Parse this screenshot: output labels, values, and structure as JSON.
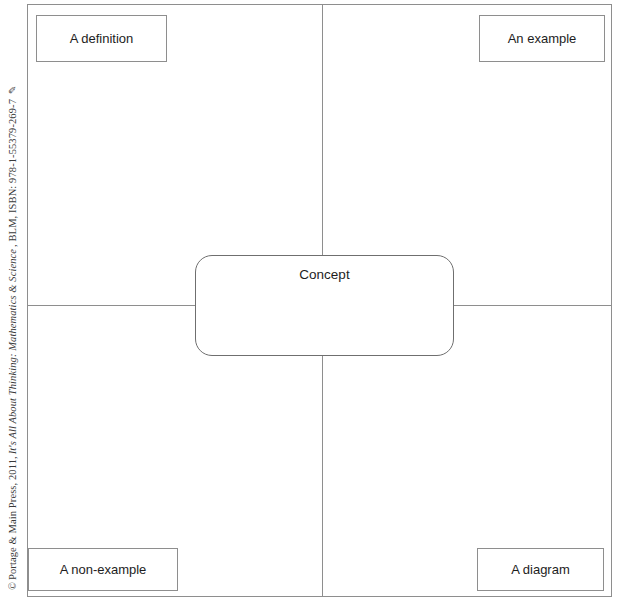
{
  "document": {
    "type": "frayer-model-concept-map",
    "background_color": "#ffffff",
    "line_color": "#8e8e8e",
    "text_color": "#1d1d1d"
  },
  "copyright": {
    "mark": "©",
    "publisher": "Portage & Main Press, 2011,",
    "title": "It's All About Thinking: Mathematics & Science",
    "suffix": ", BLM, ISBN: 978-1-55379-269-7",
    "glyph": "✎"
  },
  "center": {
    "label": "Concept"
  },
  "quadrants": {
    "top_left": {
      "label": "A definition"
    },
    "top_right": {
      "label": "An example"
    },
    "bottom_left": {
      "label": "A non-example"
    },
    "bottom_right": {
      "label": "A diagram"
    }
  }
}
